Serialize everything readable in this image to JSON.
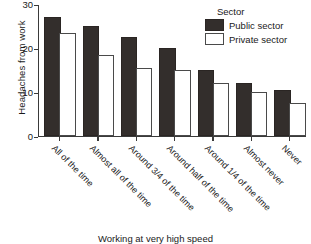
{
  "chart_data": {
    "type": "bar",
    "title": "",
    "xlabel": "Working at very high speed",
    "ylabel": "Headaches from work",
    "ylim": [
      0,
      30
    ],
    "yticks": [
      0,
      10,
      20,
      30
    ],
    "grid": false,
    "legend_title": "Sector",
    "legend_position": "top-right",
    "categories": [
      "All of the time",
      "Almost all of the time",
      "Around 3/4 of the time",
      "Around half of the time",
      "Around 1/4 of the time",
      "Almost never",
      "Never"
    ],
    "series": [
      {
        "name": "Public sector",
        "color": "#332e2c",
        "values": [
          26.5,
          24.5,
          22.0,
          19.5,
          14.5,
          11.5,
          10.0
        ]
      },
      {
        "name": "Private sector",
        "color": "#ffffff",
        "values": [
          23.0,
          18.0,
          15.0,
          14.5,
          11.5,
          9.5,
          7.0
        ]
      }
    ]
  }
}
